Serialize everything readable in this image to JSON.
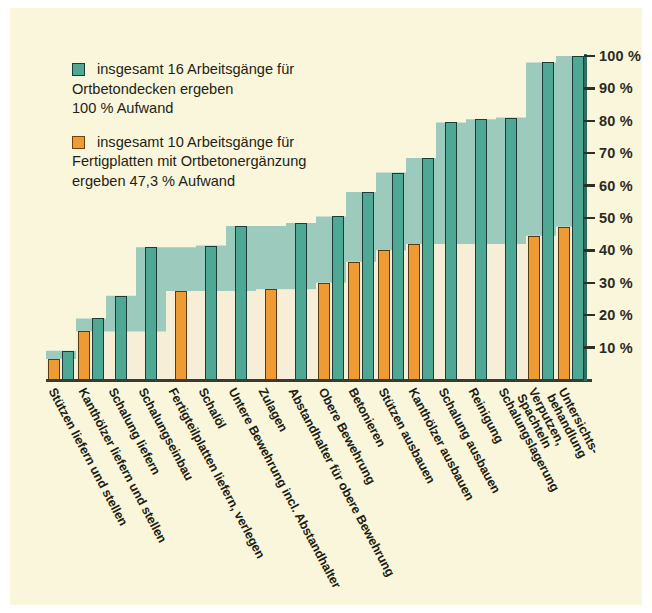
{
  "figure": {
    "background": "#FAF6DC",
    "teal_color": "#4FA893",
    "orange_color": "#EE9B33",
    "area_teal": "#9CCBBE",
    "area_cream": "#F6EED6"
  },
  "legend": {
    "items": [
      {
        "swatch": "teal",
        "color": "#4FA893",
        "text": "insgesamt 16 Arbeitsgänge für\nOrtbetondecken ergeben\n100 % Aufwand"
      },
      {
        "swatch": "orange",
        "color": "#EE9B33",
        "text": "insgesamt 10 Arbeitsgänge für\nFertigplatten mit Ortbetonergänzung\nergeben 47,3 % Aufwand"
      }
    ]
  },
  "yaxis": {
    "labels": [
      "100 %",
      "90 %",
      "80 %",
      "70 %",
      "60 %",
      "50 %",
      "40 %",
      "30 %",
      "20 %",
      "10 %"
    ],
    "values": [
      100,
      90,
      80,
      70,
      60,
      50,
      40,
      30,
      20,
      10
    ]
  },
  "xaxis": {
    "labels": [
      "Stützen liefern und stellen",
      "Kanthölzer liefern und stellen",
      "Schalung liefern",
      "Schalungseinbau",
      "Fertigteilplatten liefern, verlegen",
      "Schalöl",
      "Untere Bewehrung",
      "Zulagen",
      "Abstandhalter",
      "Obere Bewehrung",
      "Betonieren",
      "Stützen ausbauen",
      "Kanthölzer ausbauen",
      "Schalung ausbauen",
      "Reinigung",
      "Schalungslagerung",
      "Verputzen, Spachteln",
      "Untersichts-\nbehandlung"
    ],
    "extra_labels": [
      "Untere Bewehrung incl. Abstandhalter",
      "Abstandhalter für obere Bewehrung"
    ]
  },
  "chart_data": {
    "type": "bar",
    "subtitle": "kumulierter Aufwand in Prozent",
    "xlabel": "",
    "ylabel": "Aufwand in %",
    "ylim": [
      0,
      100
    ],
    "grid": false,
    "legend_position": "top-left",
    "cumulative": true,
    "categories": [
      "Stützen liefern und stellen",
      "Kanthölzer liefern und stellen",
      "Schalung liefern",
      "Schalungseinbau",
      "Fertigteilplatten liefern, verlegen",
      "Schalöl",
      "Untere Bewehrung",
      "Zulagen",
      "Abstandhalter",
      "Obere Bewehrung",
      "Betonieren",
      "Stützen ausbauen",
      "Kanthölzer ausbauen",
      "Schalung ausbauen",
      "Reinigung",
      "Schalungslagerung",
      "Verputzen, Spachteln",
      "Untersichtsbehandlung"
    ],
    "series": [
      {
        "name": "insgesamt 16 Arbeitsgänge für Ortbetondecken ergeben 100 % Aufwand",
        "color": "#4FA893",
        "total": 100,
        "values": [
          9,
          19,
          26,
          41,
          null,
          47.5,
          48.5,
          50.5,
          58,
          64,
          68.5,
          79.5,
          80.5,
          81,
          98,
          100,
          null,
          null
        ]
      },
      {
        "name": "insgesamt 10 Arbeitsgänge für Fertigplatten mit Ortbetonergänzung ergeben 47,3 % Aufwand",
        "color": "#EE9B33",
        "total": 47.3,
        "values": [
          6.5,
          15,
          null,
          null,
          27.5,
          null,
          28,
          30,
          36.5,
          40,
          42,
          null,
          null,
          44.5,
          47.3,
          null,
          null,
          null
        ]
      }
    ],
    "bars": [
      {
        "index": 0,
        "orange": 6.5,
        "teal": 9
      },
      {
        "index": 1,
        "orange": 15,
        "teal": 19
      },
      {
        "index": 2,
        "orange": null,
        "teal": 26
      },
      {
        "index": 3,
        "orange": null,
        "teal": 41
      },
      {
        "index": 4,
        "orange": 27.5,
        "teal": null
      },
      {
        "index": 5,
        "orange": null,
        "teal": 41.5
      },
      {
        "index": 6,
        "orange": null,
        "teal": 47.5
      },
      {
        "index": 7,
        "orange": 28,
        "teal": null
      },
      {
        "index": 8,
        "orange": null,
        "teal": 48.5
      },
      {
        "index": 9,
        "orange": 30,
        "teal": 50.5
      },
      {
        "index": 10,
        "orange": 36.5,
        "teal": 58
      },
      {
        "index": 11,
        "orange": 40,
        "teal": 64
      },
      {
        "index": 12,
        "orange": 42,
        "teal": 68.5
      },
      {
        "index": 13,
        "orange": null,
        "teal": 79.5
      },
      {
        "index": 14,
        "orange": null,
        "teal": 80.5
      },
      {
        "index": 15,
        "orange": null,
        "teal": 81
      },
      {
        "index": 16,
        "orange": 44.5,
        "teal": 98
      },
      {
        "index": 17,
        "orange": 47.3,
        "teal": 100
      }
    ]
  }
}
